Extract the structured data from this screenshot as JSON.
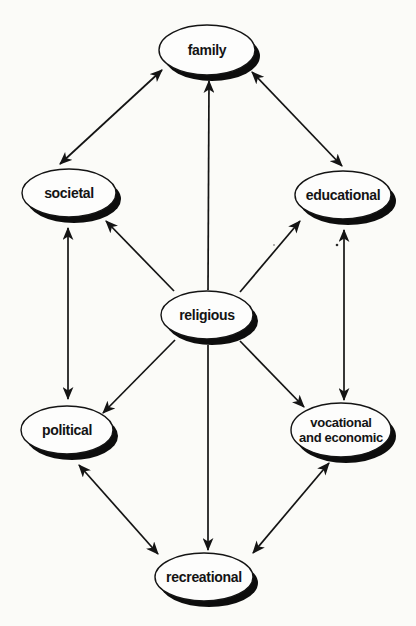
{
  "colors": {
    "background": "#fbfbf8",
    "ink": "#141414",
    "node_fill": "#fdfdfc",
    "shadow": "#0d0d0d"
  },
  "nodes": {
    "family": {
      "label": "family"
    },
    "societal": {
      "label": "societal"
    },
    "educational": {
      "label": "educational"
    },
    "religious": {
      "label": "religious"
    },
    "political": {
      "label": "political"
    },
    "vocational": {
      "label_line1": "vocational",
      "label_line2": "and economic"
    },
    "recreational": {
      "label": "recreational"
    }
  },
  "edges": [
    {
      "from": "societal",
      "to": "family",
      "arrows": "both"
    },
    {
      "from": "family",
      "to": "educational",
      "arrows": "both"
    },
    {
      "from": "religious",
      "to": "family",
      "arrows": "end"
    },
    {
      "from": "religious",
      "to": "societal",
      "arrows": "end"
    },
    {
      "from": "religious",
      "to": "educational",
      "arrows": "end"
    },
    {
      "from": "societal",
      "to": "political",
      "arrows": "both"
    },
    {
      "from": "educational",
      "to": "vocational",
      "arrows": "both"
    },
    {
      "from": "religious",
      "to": "political",
      "arrows": "end"
    },
    {
      "from": "religious",
      "to": "vocational",
      "arrows": "end"
    },
    {
      "from": "religious",
      "to": "recreational",
      "arrows": "end"
    },
    {
      "from": "political",
      "to": "recreational",
      "arrows": "both"
    },
    {
      "from": "vocational",
      "to": "recreational",
      "arrows": "both"
    }
  ]
}
